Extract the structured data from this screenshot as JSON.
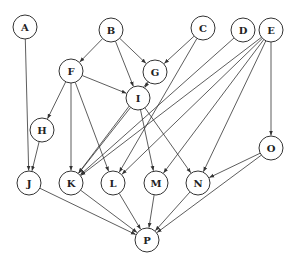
{
  "diagram": {
    "type": "directed-graph",
    "node_radius": 12,
    "colors": {
      "stroke": "#333333",
      "fill": "#ffffff",
      "text": "#222222"
    },
    "nodes": [
      {
        "id": "A",
        "label": "A",
        "x": 25,
        "y": 27
      },
      {
        "id": "B",
        "label": "B",
        "x": 111,
        "y": 30
      },
      {
        "id": "C",
        "label": "C",
        "x": 203,
        "y": 28
      },
      {
        "id": "D",
        "label": "D",
        "x": 243,
        "y": 30
      },
      {
        "id": "E",
        "label": "E",
        "x": 271,
        "y": 30
      },
      {
        "id": "F",
        "label": "F",
        "x": 71,
        "y": 71
      },
      {
        "id": "G",
        "label": "G",
        "x": 155,
        "y": 72
      },
      {
        "id": "I",
        "label": "I",
        "x": 138,
        "y": 98
      },
      {
        "id": "H",
        "label": "H",
        "x": 42,
        "y": 130
      },
      {
        "id": "J",
        "label": "J",
        "x": 29,
        "y": 183
      },
      {
        "id": "K",
        "label": "K",
        "x": 71,
        "y": 183
      },
      {
        "id": "L",
        "label": "L",
        "x": 113,
        "y": 183
      },
      {
        "id": "M",
        "label": "M",
        "x": 156,
        "y": 183
      },
      {
        "id": "N",
        "label": "N",
        "x": 198,
        "y": 183
      },
      {
        "id": "O",
        "label": "O",
        "x": 271,
        "y": 148
      },
      {
        "id": "P",
        "label": "P",
        "x": 147,
        "y": 240
      }
    ],
    "edges": [
      [
        "A",
        "J"
      ],
      [
        "B",
        "F"
      ],
      [
        "B",
        "G"
      ],
      [
        "B",
        "I"
      ],
      [
        "C",
        "G"
      ],
      [
        "C",
        "L"
      ],
      [
        "D",
        "K"
      ],
      [
        "E",
        "K"
      ],
      [
        "E",
        "L"
      ],
      [
        "E",
        "M"
      ],
      [
        "E",
        "N"
      ],
      [
        "E",
        "O"
      ],
      [
        "F",
        "H"
      ],
      [
        "F",
        "I"
      ],
      [
        "F",
        "K"
      ],
      [
        "F",
        "L"
      ],
      [
        "G",
        "I"
      ],
      [
        "G",
        "K"
      ],
      [
        "I",
        "K"
      ],
      [
        "I",
        "M"
      ],
      [
        "I",
        "N"
      ],
      [
        "H",
        "J"
      ],
      [
        "J",
        "P"
      ],
      [
        "K",
        "P"
      ],
      [
        "L",
        "P"
      ],
      [
        "M",
        "P"
      ],
      [
        "N",
        "P"
      ],
      [
        "O",
        "N"
      ],
      [
        "O",
        "P"
      ]
    ]
  }
}
